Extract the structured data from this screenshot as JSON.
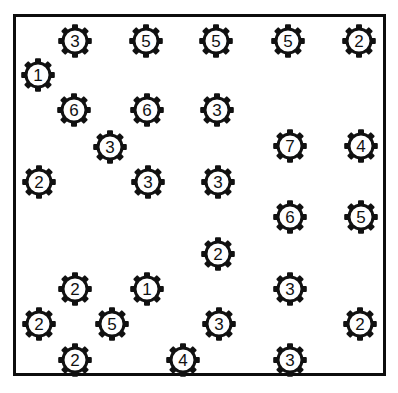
{
  "canvas": {
    "width": 398,
    "height": 393,
    "background": "#ffffff"
  },
  "frame": {
    "name": "bounding-box",
    "x": 13,
    "y": 14,
    "width": 373,
    "height": 362,
    "border_width": 3,
    "border_color": "#0d0d0d",
    "fill": "#ffffff"
  },
  "gear_style": {
    "outer_radius": 16,
    "body_radius": 13,
    "inner_radius": 10.5,
    "tooth_count": 8,
    "tooth_width": 6,
    "tooth_height": 4,
    "stroke_color": "#111111",
    "stroke_width": 3,
    "fill": "#ffffff",
    "label_color": "#111111",
    "label_font_size": 17
  },
  "chart_data": {
    "type": "scatter",
    "title": "",
    "xlabel": "",
    "ylabel": "",
    "xlim": [
      13,
      386
    ],
    "ylim": [
      14,
      376
    ],
    "grid": false,
    "legend": "none",
    "marker": "gear-icon",
    "count": 28,
    "points": [
      {
        "id": 1,
        "label": "3",
        "x": 75,
        "y": 41
      },
      {
        "id": 2,
        "label": "5",
        "x": 146,
        "y": 41
      },
      {
        "id": 3,
        "label": "5",
        "x": 216,
        "y": 41
      },
      {
        "id": 4,
        "label": "5",
        "x": 288,
        "y": 41
      },
      {
        "id": 5,
        "label": "2",
        "x": 359,
        "y": 41
      },
      {
        "id": 6,
        "label": "1",
        "x": 38,
        "y": 75
      },
      {
        "id": 7,
        "label": "6",
        "x": 74,
        "y": 110
      },
      {
        "id": 8,
        "label": "6",
        "x": 147,
        "y": 110
      },
      {
        "id": 9,
        "label": "3",
        "x": 217,
        "y": 110
      },
      {
        "id": 10,
        "label": "3",
        "x": 110,
        "y": 147
      },
      {
        "id": 11,
        "label": "7",
        "x": 290,
        "y": 146
      },
      {
        "id": 12,
        "label": "4",
        "x": 361,
        "y": 146
      },
      {
        "id": 13,
        "label": "2",
        "x": 39,
        "y": 182
      },
      {
        "id": 14,
        "label": "3",
        "x": 148,
        "y": 182
      },
      {
        "id": 15,
        "label": "3",
        "x": 218,
        "y": 182
      },
      {
        "id": 16,
        "label": "6",
        "x": 290,
        "y": 217
      },
      {
        "id": 17,
        "label": "5",
        "x": 361,
        "y": 217
      },
      {
        "id": 18,
        "label": "2",
        "x": 218,
        "y": 254
      },
      {
        "id": 19,
        "label": "2",
        "x": 75,
        "y": 289
      },
      {
        "id": 20,
        "label": "1",
        "x": 147,
        "y": 289
      },
      {
        "id": 21,
        "label": "3",
        "x": 290,
        "y": 289
      },
      {
        "id": 22,
        "label": "2",
        "x": 39,
        "y": 324
      },
      {
        "id": 23,
        "label": "5",
        "x": 112,
        "y": 324
      },
      {
        "id": 24,
        "label": "3",
        "x": 219,
        "y": 324
      },
      {
        "id": 25,
        "label": "2",
        "x": 360,
        "y": 324
      },
      {
        "id": 26,
        "label": "2",
        "x": 75,
        "y": 360
      },
      {
        "id": 27,
        "label": "4",
        "x": 183,
        "y": 360
      },
      {
        "id": 28,
        "label": "3",
        "x": 290,
        "y": 360
      }
    ]
  }
}
